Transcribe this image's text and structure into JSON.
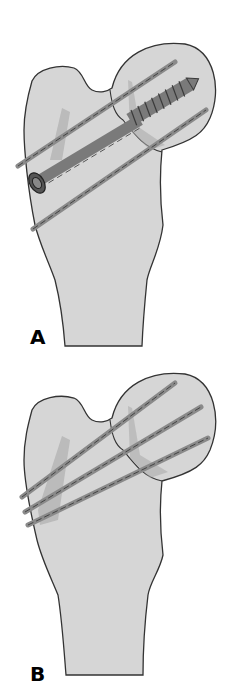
{
  "figure": {
    "panels": [
      {
        "label": "A",
        "description": "Proximal femur fixed with one cannulated lag screw (with washer) and two parallel guide pins"
      },
      {
        "label": "B",
        "description": "Proximal femur fixed with three parallel pins"
      }
    ],
    "colors": {
      "bone_fill": "#d6d6d6",
      "outline": "#333333",
      "pin_fill": "#8a8a8a",
      "screw_fill": "#7a7a7a",
      "shadow": "#a9a9a9",
      "label": "#000000"
    }
  }
}
